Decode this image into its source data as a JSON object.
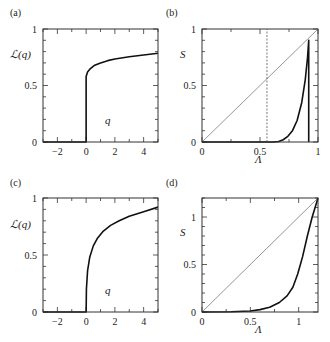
{
  "figure": {
    "panels": [
      {
        "id": "a",
        "label": "(a)"
      },
      {
        "id": "b",
        "label": "(b)"
      },
      {
        "id": "c",
        "label": "(c)"
      },
      {
        "id": "d",
        "label": "(d)"
      }
    ]
  },
  "chart_data": [
    {
      "panel": "(a)",
      "type": "line",
      "title": "",
      "xlabel": "q",
      "ylabel": "L(q)",
      "xlim": [
        -3,
        5
      ],
      "ylim": [
        0,
        1
      ],
      "xticks": [
        -2,
        0,
        2,
        4
      ],
      "yticks": [
        0,
        0.5,
        1
      ],
      "xtick_labels": [
        "−2",
        "0",
        "2",
        "4"
      ],
      "ytick_labels": [
        "0",
        "0.5",
        "1"
      ],
      "grid": false,
      "series": [
        {
          "name": "L(q)",
          "style": "solid-thick",
          "x": [
            -3,
            0,
            0,
            0.1,
            0.3,
            0.6,
            1,
            1.5,
            2,
            3,
            4,
            5
          ],
          "y": [
            0,
            0,
            0.58,
            0.62,
            0.65,
            0.68,
            0.7,
            0.72,
            0.735,
            0.755,
            0.77,
            0.785
          ]
        }
      ]
    },
    {
      "panel": "(b)",
      "type": "line",
      "title": "",
      "xlabel": "Λ",
      "ylabel": "S",
      "xlim": [
        0,
        1
      ],
      "ylim": [
        0,
        1
      ],
      "xticks": [
        0,
        0.5,
        1
      ],
      "yticks": [
        0,
        0.5,
        1
      ],
      "xtick_labels": [
        "0",
        "0.5",
        "1"
      ],
      "ytick_labels": [
        "0",
        "0.5",
        "1"
      ],
      "grid": false,
      "series": [
        {
          "name": "diagonal S = Λ",
          "style": "thin-gray",
          "x": [
            0,
            1
          ],
          "y": [
            0,
            1
          ]
        },
        {
          "name": "S(Λ)",
          "style": "solid-thick",
          "x": [
            0,
            0.62,
            0.66,
            0.7,
            0.74,
            0.78,
            0.82,
            0.86,
            0.89,
            0.91,
            0.92,
            0.92
          ],
          "y": [
            0,
            0,
            0.005,
            0.02,
            0.05,
            0.1,
            0.19,
            0.35,
            0.55,
            0.75,
            0.9,
            0
          ]
        },
        {
          "name": "threshold",
          "style": "dashed-vertical",
          "x": [
            0.56,
            0.56
          ],
          "y": [
            0,
            1
          ]
        }
      ]
    },
    {
      "panel": "(c)",
      "type": "line",
      "title": "",
      "xlabel": "q",
      "ylabel": "L(q)",
      "xlim": [
        -3,
        5
      ],
      "ylim": [
        0,
        1
      ],
      "xticks": [
        -2,
        0,
        2,
        4
      ],
      "yticks": [
        0,
        0.5,
        1
      ],
      "xtick_labels": [
        "−2",
        "0",
        "2",
        "4"
      ],
      "ytick_labels": [
        "0",
        "0.5",
        "1"
      ],
      "grid": false,
      "series": [
        {
          "name": "L(q)",
          "style": "solid-thick",
          "x": [
            -3,
            0,
            0.02,
            0.1,
            0.25,
            0.5,
            0.8,
            1.2,
            1.7,
            2.3,
            3,
            4,
            5
          ],
          "y": [
            0,
            0,
            0.2,
            0.36,
            0.48,
            0.58,
            0.65,
            0.71,
            0.76,
            0.8,
            0.84,
            0.88,
            0.92
          ]
        }
      ]
    },
    {
      "panel": "(d)",
      "type": "line",
      "title": "",
      "xlabel": "Λ",
      "ylabel": "S",
      "xlim": [
        0,
        1.2
      ],
      "ylim": [
        0,
        1.2
      ],
      "xticks": [
        0,
        0.5,
        1
      ],
      "yticks": [
        0,
        0.5,
        1
      ],
      "xtick_labels": [
        "0",
        "0.5",
        "1"
      ],
      "ytick_labels": [
        "0",
        "0.5",
        "1"
      ],
      "grid": false,
      "series": [
        {
          "name": "diagonal S = Λ",
          "style": "thin-gray",
          "x": [
            0,
            1.2
          ],
          "y": [
            0,
            1.2
          ]
        },
        {
          "name": "S(Λ)",
          "style": "solid-thick",
          "x": [
            0,
            0.3,
            0.5,
            0.6,
            0.7,
            0.8,
            0.88,
            0.94,
            0.99,
            1.04,
            1.09,
            1.14,
            1.2
          ],
          "y": [
            0,
            0.002,
            0.01,
            0.025,
            0.05,
            0.1,
            0.17,
            0.26,
            0.4,
            0.58,
            0.8,
            1.0,
            1.2
          ]
        }
      ]
    }
  ],
  "panel_layout": [
    {
      "box": [
        43,
        29,
        158,
        142
      ],
      "label_pos": [
        10,
        16
      ],
      "ylabel_pos": [
        6,
        58
      ],
      "xlabel_pos": [
        105,
        124
      ],
      "ylabel_style": "script"
    },
    {
      "box": [
        202,
        29,
        318,
        142
      ],
      "label_pos": [
        166,
        16
      ],
      "ylabel_pos": [
        180,
        58
      ],
      "xlabel_pos": [
        255,
        163
      ],
      "ylabel_style": "italic"
    },
    {
      "box": [
        43,
        198,
        158,
        312
      ],
      "label_pos": [
        10,
        186
      ],
      "ylabel_pos": [
        6,
        228
      ],
      "xlabel_pos": [
        105,
        294
      ],
      "ylabel_style": "script"
    },
    {
      "box": [
        202,
        198,
        318,
        312
      ],
      "label_pos": [
        166,
        186
      ],
      "ylabel_pos": [
        180,
        236
      ],
      "xlabel_pos": [
        255,
        333
      ],
      "ylabel_style": "italic"
    }
  ],
  "colors": {
    "curve": "#111111",
    "diagonal": "#8a8a8a",
    "axes": "#333333",
    "dashed": "#555555"
  }
}
